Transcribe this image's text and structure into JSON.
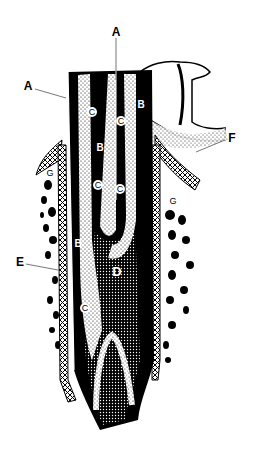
{
  "figure": {
    "type": "anatomical line drawing (longitudinal tooth root section in bone socket)",
    "colors": {
      "ink": "#000000",
      "paper": "#ffffff"
    }
  },
  "labels": {
    "a_top": {
      "text": "A",
      "x": 116,
      "y": 32
    },
    "a_left": {
      "text": "A",
      "x": 28,
      "y": 86
    },
    "b1": {
      "text": "B",
      "x": 141,
      "y": 105
    },
    "b2": {
      "text": "B",
      "x": 100,
      "y": 148
    },
    "b3": {
      "text": "B",
      "x": 78,
      "y": 244
    },
    "c1": {
      "text": "C",
      "x": 92,
      "y": 112
    },
    "c2": {
      "text": "C",
      "x": 121,
      "y": 121
    },
    "c3": {
      "text": "C",
      "x": 98,
      "y": 185
    },
    "c4": {
      "text": "C",
      "x": 120,
      "y": 189
    },
    "c5": {
      "text": "C",
      "x": 85,
      "y": 308
    },
    "d": {
      "text": "D",
      "x": 117,
      "y": 272
    },
    "e": {
      "text": "E",
      "x": 20,
      "y": 262
    },
    "f": {
      "text": "F",
      "x": 232,
      "y": 138
    },
    "g1": {
      "text": "G",
      "x": 50,
      "y": 173
    },
    "g2": {
      "text": "G",
      "x": 173,
      "y": 201
    }
  }
}
